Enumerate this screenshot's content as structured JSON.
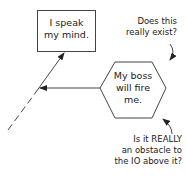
{
  "diagram": {
    "nodes": [
      {
        "id": "io-node",
        "shape": "rectangle",
        "text": "I speak\nmy mind."
      },
      {
        "id": "obstacle-node",
        "shape": "hexagon",
        "text": "My boss\nwill fire\nme."
      }
    ],
    "edges": [
      {
        "from": "obstacle-node",
        "to": "io-node-line",
        "style": "solid",
        "arrow": "end"
      },
      {
        "from": "below",
        "to": "io-node",
        "style": "dashed-then-solid",
        "arrow": "end"
      }
    ],
    "annotations": [
      {
        "id": "existence-question",
        "text": "Does this\nreally exist?",
        "points_to": "obstacle-node"
      },
      {
        "id": "obstacle-question",
        "text": "Is it REALLY\nan obstacle to\nthe IO above it?",
        "points_to": "obstacle-node"
      }
    ],
    "colors": {
      "stroke": "#333333",
      "background": "#ffffff",
      "text": "#222222"
    }
  }
}
